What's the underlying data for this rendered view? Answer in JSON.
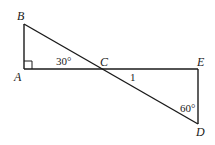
{
  "diagram": {
    "type": "geometry",
    "points": {
      "A": {
        "label": "A",
        "x": 24,
        "y": 69
      },
      "B": {
        "label": "B",
        "x": 24,
        "y": 24
      },
      "C": {
        "label": "C",
        "x": 102,
        "y": 69
      },
      "D": {
        "label": "D",
        "x": 198,
        "y": 124
      },
      "E": {
        "label": "E",
        "x": 198,
        "y": 69
      }
    },
    "segments": [
      {
        "from": "A",
        "to": "B"
      },
      {
        "from": "A",
        "to": "E"
      },
      {
        "from": "B",
        "to": "D"
      },
      {
        "from": "E",
        "to": "D"
      }
    ],
    "annotations": {
      "angle_BCA": "30°",
      "segment_CD_length": "1",
      "angle_CDE": "60°"
    },
    "right_angles": [
      "A",
      "E"
    ],
    "stroke_color": "#1a1a1a"
  }
}
